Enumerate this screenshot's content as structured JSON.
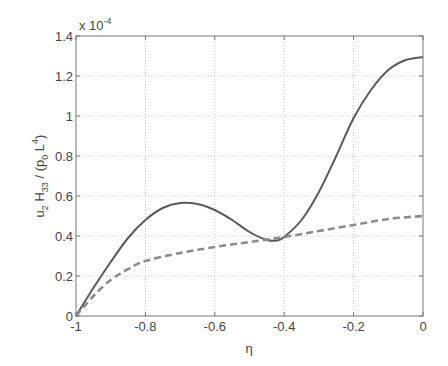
{
  "chart_data": {
    "type": "line",
    "title": "",
    "xlabel": "η",
    "ylabel": "u2 H33 / (p0 L4)",
    "ylabel_parts": {
      "u": "u",
      "u_sub": "2",
      "H": "H",
      "H_sub": "33",
      "slash": " / (p",
      "p_sub": "0",
      "L": "L",
      "L_sup": "4",
      "close": ")"
    },
    "y_multiplier": "x 10",
    "y_multiplier_exp": "-4",
    "xlim": [
      -1,
      0
    ],
    "ylim": [
      0,
      1.4
    ],
    "xticks": [
      -1,
      -0.8,
      -0.6,
      -0.4,
      -0.2,
      0
    ],
    "xtick_labels": [
      "-1",
      "-0.8",
      "-0.6",
      "-0.4",
      "-0.2",
      "0"
    ],
    "yticks": [
      0,
      0.2,
      0.4,
      0.6,
      0.8,
      1,
      1.2,
      1.4
    ],
    "ytick_labels": [
      "0",
      "0.2",
      "0.4",
      "0.6",
      "0.8",
      "1",
      "1.2",
      "1.4"
    ],
    "grid": true,
    "legend": null,
    "series": [
      {
        "name": "solid",
        "style": "solid",
        "color": "#5a5a5a",
        "x": [
          -1,
          -0.95,
          -0.9,
          -0.85,
          -0.8,
          -0.75,
          -0.7,
          -0.65,
          -0.6,
          -0.55,
          -0.5,
          -0.45,
          -0.42,
          -0.4,
          -0.35,
          -0.3,
          -0.25,
          -0.2,
          -0.15,
          -0.1,
          -0.05,
          0
        ],
        "y": [
          0,
          0.14,
          0.27,
          0.39,
          0.48,
          0.54,
          0.565,
          0.56,
          0.53,
          0.48,
          0.42,
          0.38,
          0.378,
          0.395,
          0.48,
          0.62,
          0.8,
          0.99,
          1.13,
          1.23,
          1.28,
          1.295
        ]
      },
      {
        "name": "dashed",
        "style": "dashed",
        "color": "#8c8c8c",
        "x": [
          -1,
          -0.95,
          -0.9,
          -0.85,
          -0.8,
          -0.7,
          -0.6,
          -0.5,
          -0.4,
          -0.3,
          -0.2,
          -0.1,
          0
        ],
        "y": [
          0,
          0.1,
          0.18,
          0.235,
          0.275,
          0.315,
          0.345,
          0.37,
          0.395,
          0.425,
          0.455,
          0.485,
          0.5
        ]
      }
    ]
  }
}
